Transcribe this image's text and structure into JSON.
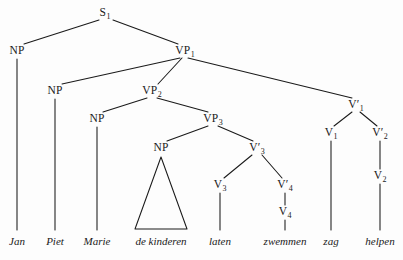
{
  "figure": {
    "kind": "syntax-tree",
    "language": "Dutch",
    "sentence": "Jan Piet Marie de kinderen laten zwemmen zag helpen",
    "ink_color": "#1a1a1a",
    "background_color": "#fdfdfd"
  },
  "nodes": [
    {
      "id": "S1",
      "label": "S",
      "prime": "",
      "sub": "1",
      "x": 105,
      "y": 13
    },
    {
      "id": "NP1",
      "label": "NP",
      "prime": "",
      "sub": "",
      "x": 17,
      "y": 51
    },
    {
      "id": "VP1",
      "label": "VP",
      "prime": "",
      "sub": "1",
      "x": 185,
      "y": 51
    },
    {
      "id": "NP2",
      "label": "NP",
      "prime": "",
      "sub": "",
      "x": 55,
      "y": 91
    },
    {
      "id": "VP2",
      "label": "VP",
      "prime": "",
      "sub": "2",
      "x": 152,
      "y": 91
    },
    {
      "id": "Vb1",
      "label": "V",
      "prime": "′",
      "sub": "1",
      "x": 356,
      "y": 105
    },
    {
      "id": "NP3",
      "label": "NP",
      "prime": "",
      "sub": "",
      "x": 97,
      "y": 119
    },
    {
      "id": "VP3",
      "label": "VP",
      "prime": "",
      "sub": "3",
      "x": 213,
      "y": 119
    },
    {
      "id": "V1",
      "label": "V",
      "prime": "",
      "sub": "1",
      "x": 331,
      "y": 133
    },
    {
      "id": "Vb2",
      "label": "V",
      "prime": "′",
      "sub": "2",
      "x": 380,
      "y": 133
    },
    {
      "id": "NP4",
      "label": "NP",
      "prime": "",
      "sub": "",
      "x": 161,
      "y": 148
    },
    {
      "id": "Vb3",
      "label": "V",
      "prime": "′",
      "sub": "3",
      "x": 257,
      "y": 148
    },
    {
      "id": "V3",
      "label": "V",
      "prime": "",
      "sub": "3",
      "x": 220,
      "y": 185
    },
    {
      "id": "Vb4",
      "label": "V",
      "prime": "′",
      "sub": "4",
      "x": 285,
      "y": 185
    },
    {
      "id": "V2",
      "label": "V",
      "prime": "",
      "sub": "2",
      "x": 380,
      "y": 176
    },
    {
      "id": "V4",
      "label": "V",
      "prime": "",
      "sub": "4",
      "x": 285,
      "y": 212
    }
  ],
  "edges": [
    {
      "from": "S1",
      "to": "NP1",
      "x1": 99,
      "y1": 20,
      "x2": 24,
      "y2": 44
    },
    {
      "from": "S1",
      "to": "VP1",
      "x1": 113,
      "y1": 20,
      "x2": 178,
      "y2": 44
    },
    {
      "from": "VP1",
      "to": "NP2",
      "x1": 180,
      "y1": 58,
      "x2": 62,
      "y2": 84
    },
    {
      "from": "VP1",
      "to": "VP2",
      "x1": 182,
      "y1": 58,
      "x2": 158,
      "y2": 84
    },
    {
      "from": "VP1",
      "to": "Vb1",
      "x1": 188,
      "y1": 58,
      "x2": 352,
      "y2": 98
    },
    {
      "from": "VP2",
      "to": "NP3",
      "x1": 147,
      "y1": 98,
      "x2": 103,
      "y2": 112
    },
    {
      "from": "VP2",
      "to": "VP3",
      "x1": 157,
      "y1": 98,
      "x2": 208,
      "y2": 112
    },
    {
      "from": "VP3",
      "to": "NP4",
      "x1": 208,
      "y1": 126,
      "x2": 167,
      "y2": 141
    },
    {
      "from": "VP3",
      "to": "Vb3",
      "x1": 218,
      "y1": 126,
      "x2": 253,
      "y2": 141
    },
    {
      "from": "Vb1",
      "to": "V1",
      "x1": 352,
      "y1": 112,
      "x2": 334,
      "y2": 126
    },
    {
      "from": "Vb1",
      "to": "Vb2",
      "x1": 360,
      "y1": 112,
      "x2": 377,
      "y2": 126
    },
    {
      "from": "Vb3",
      "to": "V3",
      "x1": 252,
      "y1": 155,
      "x2": 224,
      "y2": 178
    },
    {
      "from": "Vb3",
      "to": "Vb4",
      "x1": 262,
      "y1": 155,
      "x2": 282,
      "y2": 178
    },
    {
      "from": "NP1",
      "to": "Jan",
      "x1": 17,
      "y1": 59,
      "x2": 17,
      "y2": 230
    },
    {
      "from": "NP2",
      "to": "Piet",
      "x1": 55,
      "y1": 99,
      "x2": 55,
      "y2": 230
    },
    {
      "from": "NP3",
      "to": "Marie",
      "x1": 97,
      "y1": 127,
      "x2": 97,
      "y2": 230
    },
    {
      "from": "V3",
      "to": "laten",
      "x1": 220,
      "y1": 193,
      "x2": 220,
      "y2": 230
    },
    {
      "from": "Vb4",
      "to": "V4",
      "x1": 285,
      "y1": 193,
      "x2": 285,
      "y2": 205
    },
    {
      "from": "V4",
      "to": "zwemmen",
      "x1": 285,
      "y1": 220,
      "x2": 285,
      "y2": 230
    },
    {
      "from": "V1",
      "to": "zag",
      "x1": 331,
      "y1": 141,
      "x2": 331,
      "y2": 230
    },
    {
      "from": "Vb2",
      "to": "V2",
      "x1": 380,
      "y1": 141,
      "x2": 380,
      "y2": 169
    },
    {
      "from": "V2",
      "to": "helpen",
      "x1": 380,
      "y1": 184,
      "x2": 380,
      "y2": 230
    }
  ],
  "triangle": {
    "parent": "NP4",
    "covers": "de kinderen",
    "apex_x": 161,
    "apex_y": 157,
    "left_x": 135,
    "right_x": 187,
    "base_y": 229
  },
  "leaves": [
    {
      "id": "Jan",
      "text": "Jan",
      "x": 17,
      "y": 241
    },
    {
      "id": "Piet",
      "text": "Piet",
      "x": 55,
      "y": 241
    },
    {
      "id": "Marie",
      "text": "Marie",
      "x": 97,
      "y": 241
    },
    {
      "id": "kinderen",
      "text": "de kinderen",
      "x": 161,
      "y": 241
    },
    {
      "id": "laten",
      "text": "laten",
      "x": 220,
      "y": 241
    },
    {
      "id": "zwemmen",
      "text": "zwemmen",
      "x": 285,
      "y": 241
    },
    {
      "id": "zag",
      "text": "zag",
      "x": 331,
      "y": 241
    },
    {
      "id": "helpen",
      "text": "helpen",
      "x": 380,
      "y": 241
    }
  ]
}
